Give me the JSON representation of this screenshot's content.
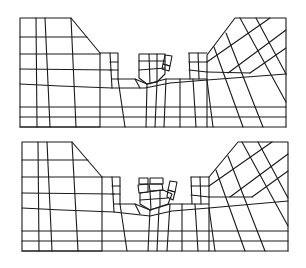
{
  "figure": {
    "type": "finite-element mesh diagram",
    "panels": [
      {
        "id": "top",
        "description": "Excavated trench mesh, early stage: central block group partially displaced"
      },
      {
        "id": "bottom",
        "description": "Excavated trench mesh, later stage: central block group further displaced/tilted"
      }
    ],
    "colors": {
      "line": "#1a1a1a",
      "background": "#ffffff"
    }
  }
}
